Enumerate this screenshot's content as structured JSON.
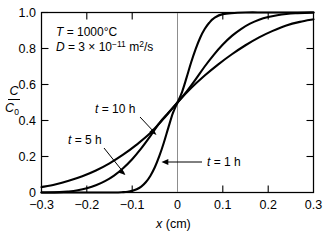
{
  "chart_data": {
    "type": "line",
    "title": "",
    "xlabel": "x (cm)",
    "ylabel": "C/C0",
    "ylabel_numerator": "C",
    "ylabel_denominator": "C",
    "ylabel_denominator_sub": "0",
    "xlim": [
      -0.3,
      0.3
    ],
    "ylim": [
      0.0,
      1.0
    ],
    "grid": false,
    "legend_position": "inline-annotations",
    "xticks": [
      "−0.3",
      "−0.2",
      "−0.1",
      "0",
      "0.1",
      "0.2",
      "0.3"
    ],
    "xtick_values": [
      -0.3,
      -0.2,
      -0.1,
      0,
      0.1,
      0.2,
      0.3
    ],
    "yticks": [
      "0",
      "0.2",
      "0.4",
      "0.6",
      "0.8",
      "1.0"
    ],
    "ytick_values": [
      0,
      0.2,
      0.4,
      0.6,
      0.8,
      1.0
    ],
    "annotations": {
      "temperature": "T = 1000°C",
      "temperature_symbol": "T",
      "temperature_value": "1000°C",
      "diffusivity_symbol": "D",
      "diffusivity_mantissa": "3 × 10",
      "diffusivity_exponent": "−11",
      "diffusivity_units": "m",
      "diffusivity_units_sup": "2",
      "diffusivity_units_rest": "/s"
    },
    "series": [
      {
        "name": "t = 1 h",
        "label_symbol": "t",
        "label_value": "= 1 h",
        "time_hours": 1,
        "x": [
          -0.3,
          -0.2,
          -0.14,
          -0.12,
          -0.11,
          -0.1,
          -0.09,
          -0.08,
          -0.07,
          -0.06,
          -0.05,
          -0.04,
          -0.03,
          -0.02,
          -0.01,
          0.0,
          0.01,
          0.02,
          0.03,
          0.04,
          0.05,
          0.06,
          0.07,
          0.08,
          0.1,
          0.15,
          0.2,
          0.3
        ],
        "y": [
          0.0,
          0.0,
          0.0,
          0.002,
          0.004,
          0.009,
          0.018,
          0.033,
          0.057,
          0.092,
          0.14,
          0.203,
          0.278,
          0.362,
          0.442,
          0.5,
          0.558,
          0.638,
          0.722,
          0.797,
          0.86,
          0.908,
          0.943,
          0.967,
          0.991,
          1.0,
          1.0,
          1.0
        ]
      },
      {
        "name": "t = 5 h",
        "label_symbol": "t",
        "label_value": "= 5 h",
        "time_hours": 5,
        "x": [
          -0.3,
          -0.26,
          -0.24,
          -0.22,
          -0.2,
          -0.18,
          -0.16,
          -0.14,
          -0.12,
          -0.1,
          -0.08,
          -0.06,
          -0.04,
          -0.02,
          0.0,
          0.02,
          0.04,
          0.06,
          0.08,
          0.1,
          0.12,
          0.14,
          0.16,
          0.18,
          0.2,
          0.22,
          0.24,
          0.26,
          0.3
        ],
        "y": [
          0.0,
          0.002,
          0.006,
          0.013,
          0.024,
          0.04,
          0.063,
          0.094,
          0.135,
          0.185,
          0.245,
          0.313,
          0.386,
          0.443,
          0.5,
          0.56,
          0.628,
          0.7,
          0.765,
          0.822,
          0.87,
          0.908,
          0.938,
          0.96,
          0.975,
          0.985,
          0.992,
          0.996,
          1.0
        ]
      },
      {
        "name": "t = 10 h",
        "label_symbol": "t",
        "label_value": "= 10 h",
        "time_hours": 10,
        "x": [
          -0.3,
          -0.27,
          -0.24,
          -0.21,
          -0.18,
          -0.15,
          -0.12,
          -0.09,
          -0.06,
          -0.03,
          0.0,
          0.03,
          0.06,
          0.09,
          0.12,
          0.15,
          0.18,
          0.21,
          0.24,
          0.27,
          0.3
        ],
        "y": [
          0.03,
          0.045,
          0.065,
          0.09,
          0.122,
          0.162,
          0.21,
          0.266,
          0.33,
          0.412,
          0.5,
          0.58,
          0.65,
          0.712,
          0.768,
          0.818,
          0.862,
          0.898,
          0.928,
          0.948,
          0.962
        ]
      }
    ]
  }
}
